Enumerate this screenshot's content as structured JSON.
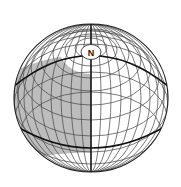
{
  "diagram": {
    "type": "globe",
    "pole_label": "N",
    "colors": {
      "background": "#ffffff",
      "shaded": "#bdbdbd",
      "grid": "#333333",
      "outline": "#222222"
    },
    "shaded_region": "western hemisphere between tropic-like bold circle and southern bold line",
    "bold_lines": [
      "prime meridian",
      "tilted upper circle",
      "equator-like lower circle"
    ]
  }
}
